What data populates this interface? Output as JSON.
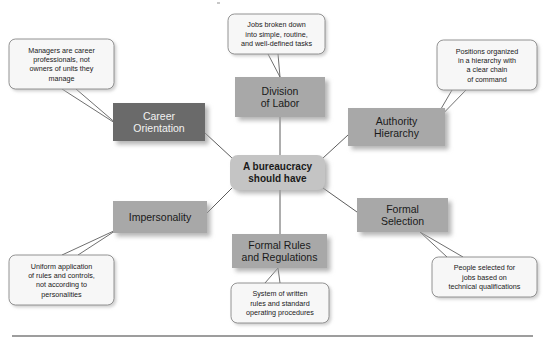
{
  "diagram": {
    "type": "radial-concept-map",
    "canvas": {
      "width": 545,
      "height": 345,
      "background": "#ffffff"
    },
    "colors": {
      "center_fill": "#c4c4c4",
      "node_fill": "#a8a8a8",
      "node_fill_dark": "#6b6b6b",
      "callout_fill": "#f7f7f7",
      "callout_stroke": "#7a7a7a",
      "connector_stroke": "#4a4a4a",
      "text": "#1a1a1a",
      "text_inverse": "#f2f2f2",
      "shadow": "#b9b9b9",
      "rule": "#3c3c3c"
    },
    "center": {
      "id": "center",
      "label_lines": [
        "A bureaucracy",
        "should have"
      ],
      "x": 230,
      "y": 155,
      "w": 95,
      "h": 35,
      "shape": "rounded-rect",
      "fill": "#c4c4c4",
      "dark": false
    },
    "nodes": [
      {
        "id": "division-of-labor",
        "label_lines": [
          "Division",
          "of Labor"
        ],
        "x": 235,
        "y": 77,
        "w": 90,
        "h": 40,
        "fill": "#a8a8a8",
        "dark": false,
        "anchor_center": {
          "x": 280,
          "y": 117
        },
        "callout_id": "callout-division-of-labor"
      },
      {
        "id": "career-orientation",
        "label_lines": [
          "Career",
          "Orientation"
        ],
        "x": 113,
        "y": 103,
        "w": 92,
        "h": 38,
        "fill": "#6b6b6b",
        "dark": true,
        "anchor_center": {
          "x": 205,
          "y": 128
        },
        "callout_id": "callout-career-orientation"
      },
      {
        "id": "authority-hierarchy",
        "label_lines": [
          "Authority",
          "Hierarchy"
        ],
        "x": 348,
        "y": 108,
        "w": 97,
        "h": 38,
        "fill": "#a8a8a8",
        "dark": false,
        "anchor_center": {
          "x": 348,
          "y": 132
        },
        "callout_id": "callout-authority-hierarchy"
      },
      {
        "id": "impersonality",
        "label_lines": [
          "Impersonality"
        ],
        "x": 113,
        "y": 201,
        "w": 94,
        "h": 32,
        "fill": "#a8a8a8",
        "dark": false,
        "anchor_center": {
          "x": 207,
          "y": 212
        },
        "callout_id": "callout-impersonality"
      },
      {
        "id": "formal-selection",
        "label_lines": [
          "Formal",
          "Selection"
        ],
        "x": 357,
        "y": 198,
        "w": 91,
        "h": 34,
        "fill": "#a8a8a8",
        "dark": false,
        "anchor_center": {
          "x": 357,
          "y": 209
        },
        "callout_id": "callout-formal-selection"
      },
      {
        "id": "formal-rules-and-regulations",
        "label_lines": [
          "Formal Rules",
          "and Regulations"
        ],
        "x": 232,
        "y": 234,
        "w": 95,
        "h": 34,
        "fill": "#a8a8a8",
        "dark": false,
        "anchor_center": {
          "x": 280,
          "y": 234
        },
        "callout_id": "callout-formal-rules-and-regulations"
      }
    ],
    "callouts": [
      {
        "id": "callout-division-of-labor",
        "for": "division-of-labor",
        "lines": [
          "Jobs broken down",
          "into simple, routine,",
          "and well-defined tasks"
        ],
        "x": 228,
        "y": 14,
        "w": 97,
        "h": 40,
        "tail": [
          [
            268,
            54
          ],
          [
            280,
            77
          ],
          [
            278,
            54
          ]
        ]
      },
      {
        "id": "callout-career-orientation",
        "for": "career-orientation",
        "lines": [
          "Managers are career",
          "professionals, not",
          "owners of units they",
          "manage"
        ],
        "x": 9,
        "y": 39,
        "w": 105,
        "h": 50,
        "tail": [
          [
            62,
            89
          ],
          [
            118,
            125
          ],
          [
            76,
            89
          ]
        ]
      },
      {
        "id": "callout-authority-hierarchy",
        "for": "authority-hierarchy",
        "lines": [
          "Positions organized",
          "in a hierarchy with",
          "a clear chain",
          "of command"
        ],
        "x": 437,
        "y": 40,
        "w": 100,
        "h": 50,
        "tail": [
          [
            452,
            90
          ],
          [
            431,
            126
          ],
          [
            466,
            90
          ]
        ]
      },
      {
        "id": "callout-impersonality",
        "for": "impersonality",
        "lines": [
          "Uniform application",
          "of rules and controls,",
          "not according to",
          "personalities"
        ],
        "x": 9,
        "y": 255,
        "w": 105,
        "h": 50,
        "tail": [
          [
            62,
            255
          ],
          [
            118,
            229
          ],
          [
            78,
            255
          ]
        ]
      },
      {
        "id": "callout-formal-selection",
        "for": "formal-selection",
        "lines": [
          "People selected for",
          "jobs based on",
          "technical qualifications"
        ],
        "x": 432,
        "y": 257,
        "w": 105,
        "h": 40,
        "tail": [
          [
            447,
            257
          ],
          [
            420,
            232
          ],
          [
            463,
            257
          ]
        ]
      },
      {
        "id": "callout-formal-rules-and-regulations",
        "for": "formal-rules-and-regulations",
        "lines": [
          "System of written",
          "rules and standard",
          "operating procedures"
        ],
        "x": 231,
        "y": 283,
        "w": 98,
        "h": 40,
        "tail": [
          [
            265,
            283
          ],
          [
            278,
            268
          ],
          [
            280,
            283
          ]
        ]
      }
    ],
    "connectors": [
      {
        "id": "connector-center-division-of-labor",
        "from": "center",
        "to": "division-of-labor",
        "x1": 280,
        "y1": 155,
        "x2": 280,
        "y2": 117
      },
      {
        "id": "connector-center-career-orientation",
        "from": "center",
        "to": "career-orientation",
        "x1": 232,
        "y1": 158,
        "x2": 205,
        "y2": 133
      },
      {
        "id": "connector-center-authority-hierarchy",
        "from": "center",
        "to": "authority-hierarchy",
        "x1": 323,
        "y1": 158,
        "x2": 348,
        "y2": 135
      },
      {
        "id": "connector-center-impersonality",
        "from": "center",
        "to": "impersonality",
        "x1": 232,
        "y1": 188,
        "x2": 207,
        "y2": 213
      },
      {
        "id": "connector-center-formal-selection",
        "from": "center",
        "to": "formal-selection",
        "x1": 323,
        "y1": 188,
        "x2": 357,
        "y2": 212
      },
      {
        "id": "connector-center-formal-rules-and-regulations",
        "from": "center",
        "to": "formal-rules-and-regulations",
        "x1": 280,
        "y1": 190,
        "x2": 280,
        "y2": 234
      }
    ],
    "bottom_rule": {
      "x1": 12,
      "y1": 336,
      "x2": 533,
      "y2": 336
    },
    "artifact_speck": {
      "x": 217,
      "y": 2,
      "w": 3,
      "h": 2
    }
  }
}
